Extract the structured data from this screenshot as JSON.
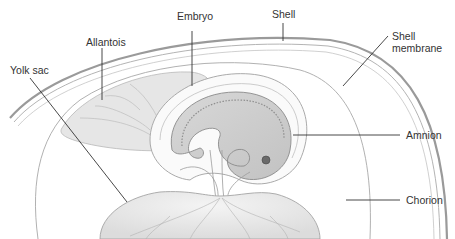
{
  "diagram": {
    "labels": {
      "embryo": "Embryo",
      "shell": "Shell",
      "allantois": "Allantois",
      "yolk_sac": "Yolk sac",
      "shell_membrane_line1": "Shell",
      "shell_membrane_line2": "membrane",
      "amnion": "Amnion",
      "chorion": "Chorion"
    },
    "colors": {
      "background": "#ffffff",
      "label_text": "#333333",
      "leader_line": "#333333",
      "shell": "#9a9a9a",
      "membrane_line": "#a8a8a8",
      "tissue_fill": "#e4e4e4",
      "embryo_fill": "#cfcfcf",
      "vessel": "#b0b0b0"
    }
  }
}
